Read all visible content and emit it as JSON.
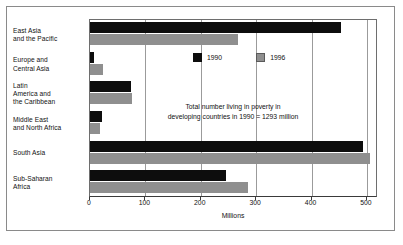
{
  "figure": {
    "border_color": "#8a8a8a",
    "background": "#ffffff"
  },
  "chart_data": {
    "type": "bar",
    "orientation": "horizontal",
    "title": "",
    "subtitle": "",
    "xlabel": "Millions",
    "ylabel": "",
    "xlim": [
      0,
      520
    ],
    "ylim": null,
    "grid": true,
    "grid_axis": "x",
    "legend_position": "inside-top-right",
    "categories": [
      "East Asia and the Pacific",
      "Europe and Central Asia",
      "Latin America and the Caribbean",
      "Middle East and North Africa",
      "South Asia",
      "Sub-Saharan Africa"
    ],
    "category_label_lines": [
      [
        "East Asia",
        "and the Pacific"
      ],
      [
        "Europe and",
        "Central Asia"
      ],
      [
        "Latin",
        "America and",
        "the Caribbean"
      ],
      [
        "Middle East",
        "and North Africa"
      ],
      [
        "South Asia"
      ],
      [
        "Sub-Saharan",
        "Africa"
      ]
    ],
    "series": [
      {
        "name": "1990",
        "color": "#0d0d0d",
        "values": [
          453,
          7,
          74,
          21,
          493,
          245
        ]
      },
      {
        "name": "1996",
        "color": "#8f8f8f",
        "values": [
          268,
          23,
          76,
          18,
          505,
          285
        ]
      }
    ],
    "xticks": [
      0,
      100,
      200,
      300,
      400,
      500
    ],
    "xtick_labels": [
      "0",
      "100",
      "200",
      "300",
      "400",
      "500"
    ],
    "annotations": [
      {
        "name": "poverty-total-note",
        "lines": [
          "Total number living in poverty in",
          "developing countries in 1990 = 1293 million"
        ]
      }
    ]
  },
  "legend": {
    "items": [
      {
        "label": "1990",
        "swatch": "black-square-icon"
      },
      {
        "label": "1996",
        "swatch": "gray-square-icon"
      }
    ]
  }
}
